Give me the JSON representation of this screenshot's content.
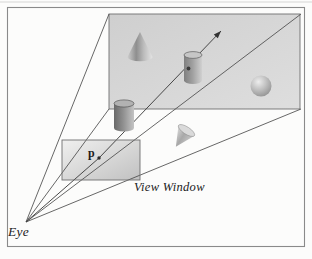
{
  "figure": {
    "labels": {
      "eye": "Eye",
      "view_window": "View Window",
      "point": "p"
    },
    "colors": {
      "line": "#4b4b4b",
      "frame_border": "#8a8a8a",
      "scene_fill": "#d6d6d6",
      "window_fill": "#d9d9d9",
      "background": "#fcfcfb"
    },
    "objects": [
      "cone",
      "cylinder",
      "sphere",
      "foreground-cylinder",
      "tilted-cone"
    ]
  }
}
